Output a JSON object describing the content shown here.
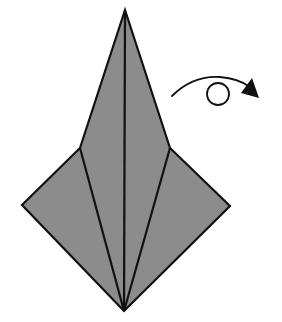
{
  "diagram": {
    "type": "origami-step",
    "colors": {
      "paper_fill": "#8c8c8c",
      "stroke": "#111111",
      "background": "#ffffff"
    },
    "shape": {
      "vertices": {
        "top": [
          125,
          10
        ],
        "upper_left": [
          80,
          148
        ],
        "upper_right": [
          170,
          148
        ],
        "left": [
          22,
          205
        ],
        "right": [
          230,
          206
        ],
        "bottom": [
          124,
          311
        ]
      },
      "creases": [
        {
          "name": "center-crease",
          "from": [
            125,
            10
          ],
          "to": [
            124,
            311
          ]
        },
        {
          "name": "left-crease",
          "from": [
            80,
            148
          ],
          "to": [
            124,
            311
          ]
        },
        {
          "name": "right-crease",
          "from": [
            170,
            148
          ],
          "to": [
            124,
            311
          ]
        }
      ]
    },
    "arrow": {
      "kind": "turn-over-arrow",
      "meaning": "turn the model over",
      "start": [
        172,
        96
      ],
      "loop_center": [
        218,
        93
      ],
      "loop_radius": 11,
      "tip": [
        259,
        97
      ]
    }
  }
}
